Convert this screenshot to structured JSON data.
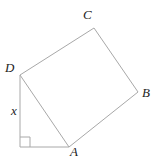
{
  "diagram": {
    "labels": {
      "A": "A",
      "B": "B",
      "C": "C",
      "D": "D",
      "x": "x"
    },
    "colors": {
      "line": "#a8a8a8",
      "text": "#1c1c1c",
      "background": "#ffffff"
    }
  },
  "geometry": {
    "vertices": {
      "A": [
        69,
        147
      ],
      "B": [
        138,
        92
      ],
      "C": [
        94,
        28
      ],
      "D": [
        20,
        75
      ]
    },
    "right_angle_corner": [
      20,
      147
    ],
    "right_angle_mark_size": 10
  }
}
